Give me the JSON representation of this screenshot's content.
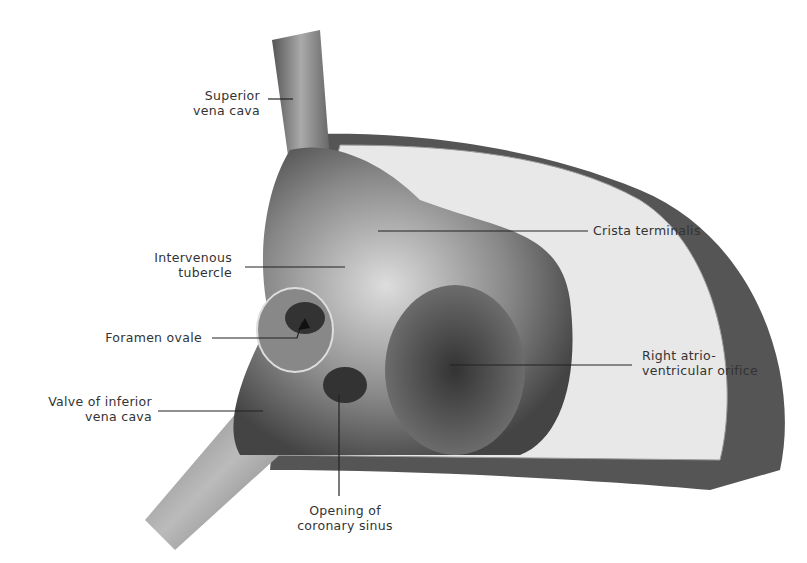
{
  "figure": {
    "labels": {
      "superior_vena_cava": [
        "Superior",
        "vena cava"
      ],
      "crista_terminalis": [
        "Crista terminalis"
      ],
      "intervenous_tubercle": [
        "Intervenous",
        "tubercle"
      ],
      "foramen_ovale": [
        "Foramen ovale"
      ],
      "right_av_orifice": [
        "Right atrio-",
        "ventricular orifice"
      ],
      "valve_ivc": [
        "Valve of inferior",
        "vena cava"
      ],
      "coronary_sinus": [
        "Opening of",
        "coronary sinus"
      ]
    }
  }
}
